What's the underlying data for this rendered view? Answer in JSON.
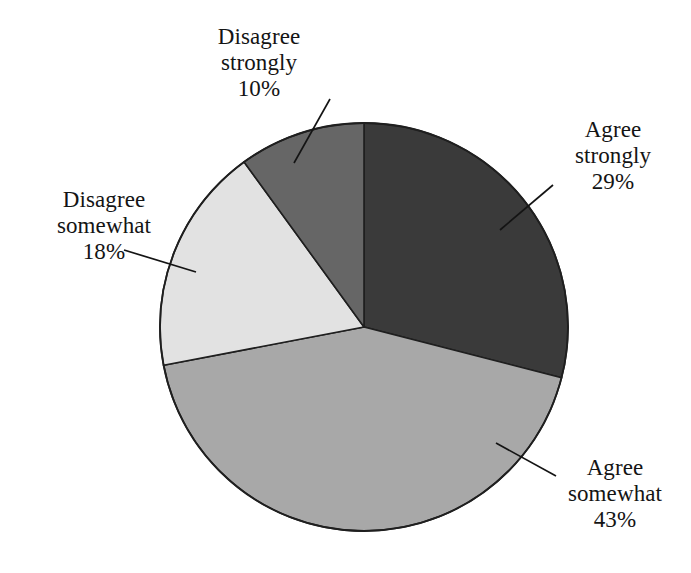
{
  "chart_data": {
    "type": "pie",
    "title": "",
    "subtitle": "",
    "xlabel": "",
    "ylabel": "",
    "legend_position": "none",
    "grid": false,
    "units": "percent",
    "total": 100,
    "start_angle_deg": 0,
    "direction": "clockwise",
    "categories": [
      "Agree strongly",
      "Agree somewhat",
      "Disagree somewhat",
      "Disagree strongly"
    ],
    "values": [
      29,
      43,
      18,
      10
    ],
    "slices": [
      {
        "label_line1": "Agree",
        "label_line2": "strongly",
        "label": "Agree strongly",
        "value": 29,
        "value_text": "29%",
        "color": "#3a3a3a",
        "start_deg": 0,
        "end_deg": 104.4
      },
      {
        "label_line1": "Agree",
        "label_line2": "somewhat",
        "label": "Agree somewhat",
        "value": 43,
        "value_text": "43%",
        "color": "#a8a8a8",
        "start_deg": 104.4,
        "end_deg": 259.2
      },
      {
        "label_line1": "Disagree",
        "label_line2": "somewhat",
        "label": "Disagree somewhat",
        "value": 18,
        "value_text": "18%",
        "color": "#e2e2e2",
        "start_deg": 259.2,
        "end_deg": 324.0
      },
      {
        "label_line1": "Disagree",
        "label_line2": "strongly",
        "label": "Disagree strongly",
        "value": 10,
        "value_text": "10%",
        "color": "#666666",
        "start_deg": 324.0,
        "end_deg": 360.0
      }
    ],
    "colors": {
      "agree_strongly": "#3a3a3a",
      "agree_somewhat": "#a8a8a8",
      "disagree_somewhat": "#e2e2e2",
      "disagree_strongly": "#666666",
      "outline": "#1f1f1f",
      "background": "#ffffff",
      "text": "#141414"
    }
  }
}
